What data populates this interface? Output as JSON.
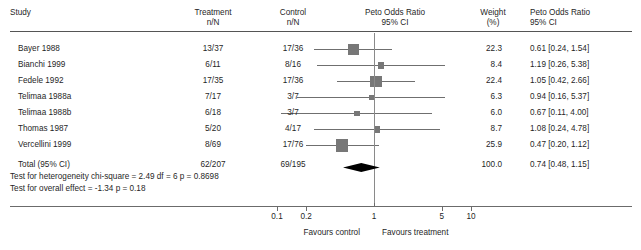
{
  "columns": {
    "study": "Study",
    "treatment": "Treatment\nn/N",
    "control": "Control\nn/N",
    "plot": "Peto Odds Ratio\n95% CI",
    "weight": "Weight\n(%)",
    "effect": "Peto Odds Ratio\n95% CI"
  },
  "rows": [
    {
      "study": "Bayer 1988",
      "treatment": "13/37",
      "control": "17/36",
      "weight": "22.3",
      "effect": "0.61 [0.24, 1.54]",
      "or": 0.61,
      "lcl": 0.24,
      "ucl": 1.54,
      "wt": 22.3
    },
    {
      "study": "Bianchi 1999",
      "treatment": "6/11",
      "control": "8/16",
      "weight": "8.4",
      "effect": "1.19 [0.26, 5.38]",
      "or": 1.19,
      "lcl": 0.26,
      "ucl": 5.38,
      "wt": 8.4
    },
    {
      "study": "Fedele 1992",
      "treatment": "17/35",
      "control": "17/36",
      "weight": "22.4",
      "effect": "1.05 [0.42, 2.66]",
      "or": 1.05,
      "lcl": 0.42,
      "ucl": 2.66,
      "wt": 22.4
    },
    {
      "study": "Telimaa 1988a",
      "treatment": "7/17",
      "control": "3/7",
      "weight": "6.3",
      "effect": "0.94 [0.16, 5.37]",
      "or": 0.94,
      "lcl": 0.16,
      "ucl": 5.37,
      "wt": 6.3
    },
    {
      "study": "Telimaa 1988b",
      "treatment": "6/18",
      "control": "3/7",
      "weight": "6.0",
      "effect": "0.67 [0.11, 4.00]",
      "or": 0.67,
      "lcl": 0.11,
      "ucl": 4.0,
      "wt": 6.0
    },
    {
      "study": "Thomas 1987",
      "treatment": "5/20",
      "control": "4/17",
      "weight": "8.7",
      "effect": "1.08 [0.24, 4.78]",
      "or": 1.08,
      "lcl": 0.24,
      "ucl": 4.78,
      "wt": 8.7
    },
    {
      "study": "Vercellini 1999",
      "treatment": "8/69",
      "control": "17/76",
      "weight": "25.9",
      "effect": "0.47 [0.20, 1.12]",
      "or": 0.47,
      "lcl": 0.2,
      "ucl": 1.12,
      "wt": 25.9
    }
  ],
  "total": {
    "label": "Total (95% CI)",
    "treatment": "62/207",
    "control": "69/195",
    "weight": "100.0",
    "effect": "0.74 [0.48, 1.15]",
    "or": 0.74,
    "lcl": 0.48,
    "ucl": 1.15
  },
  "stats": {
    "heterogeneity": "Test for heterogeneity chi-square = 2.49 df = 6 p = 0.8698",
    "overall": "Test for overall effect = -1.34 p = 0.18"
  },
  "axis": {
    "ticks": [
      {
        "label": "0.1",
        "value": 0.1
      },
      {
        "label": "0.2",
        "value": 0.2
      },
      {
        "label": "1",
        "value": 1
      },
      {
        "label": "5",
        "value": 5
      },
      {
        "label": "10",
        "value": 10
      }
    ],
    "favours_left": "Favours control",
    "favours_right": "Favours treatment",
    "null_value": 1
  },
  "chart_data": {
    "type": "forest",
    "title": "Peto Odds Ratio 95% CI",
    "xlabel": "Peto Odds Ratio",
    "xscale": "log",
    "xlim": [
      0.07,
      16
    ],
    "null_line": 1,
    "categories": [
      "Bayer 1988",
      "Bianchi 1999",
      "Fedele 1992",
      "Telimaa 1988a",
      "Telimaa 1988b",
      "Thomas 1987",
      "Vercellini 1999",
      "Total (95% CI)"
    ],
    "values": [
      0.61,
      1.19,
      1.05,
      0.94,
      0.67,
      1.08,
      0.47,
      0.74
    ],
    "lower": [
      0.24,
      0.26,
      0.42,
      0.16,
      0.11,
      0.24,
      0.2,
      0.48
    ],
    "upper": [
      1.54,
      5.38,
      2.66,
      5.37,
      4.0,
      4.78,
      1.12,
      1.15
    ],
    "weights": [
      22.3,
      8.4,
      22.4,
      6.3,
      6.0,
      8.7,
      25.9,
      100.0
    ],
    "treatment_events": [
      "13/37",
      "6/11",
      "17/35",
      "7/17",
      "6/18",
      "5/20",
      "8/69",
      "62/207"
    ],
    "control_events": [
      "17/36",
      "8/16",
      "17/36",
      "3/7",
      "3/7",
      "4/17",
      "17/76",
      "69/195"
    ],
    "legend": [
      "Favours control",
      "Favours treatment"
    ],
    "ticks": [
      0.1,
      0.2,
      1,
      5,
      10
    ],
    "grid": false
  },
  "colors": {
    "marker": "#777777",
    "ci": "#6f6f6f",
    "diamond": "#000000",
    "axis": "#6b6b6b",
    "rule": "#555555",
    "text": "#1f1f1f"
  }
}
